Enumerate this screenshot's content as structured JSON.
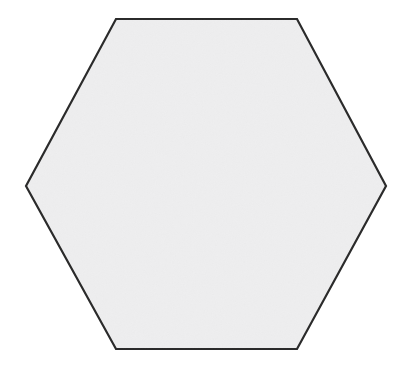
{
  "figure": {
    "shape_name": "regular-hexagon",
    "orientation": "flat-top",
    "canvas": {
      "width": 416,
      "height": 390,
      "background_color": "#ffffff"
    },
    "style": {
      "fill_color": "#eeeeef",
      "stroke_color": "#2a2a2a",
      "stroke_width": 2.2,
      "stroke_linejoin": "miter"
    },
    "geometry": {
      "sides": 6,
      "vertex_count": 6,
      "center": {
        "x": 206,
        "y": 184
      },
      "width": 360,
      "height": 330,
      "vertices": [
        {
          "name": "top-left",
          "x": 116,
          "y": 19
        },
        {
          "name": "top-right",
          "x": 297,
          "y": 19
        },
        {
          "name": "right",
          "x": 386,
          "y": 186
        },
        {
          "name": "bottom-right",
          "x": 297,
          "y": 349
        },
        {
          "name": "bottom-left",
          "x": 116,
          "y": 349
        },
        {
          "name": "left",
          "x": 26,
          "y": 186
        }
      ],
      "points_attr": "116,19 297,19 386,186 297,349 116,349 26,186"
    }
  }
}
